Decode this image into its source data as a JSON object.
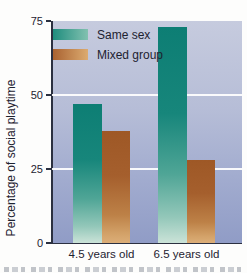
{
  "figure": {
    "type_note": "scanned textbook bar chart"
  },
  "chart_data": {
    "type": "bar",
    "title": "",
    "xlabel": "",
    "ylabel": "Percentage of social playtime",
    "categories": [
      "4.5 years old",
      "6.5 years old"
    ],
    "series": [
      {
        "name": "Same sex",
        "values": [
          47,
          73
        ],
        "color_top": "#0d7e74",
        "color_bottom": "#cbe3d8",
        "legend_gradient_left": "#1f8d7e",
        "legend_gradient_right": "#82c1b0"
      },
      {
        "name": "Mixed group",
        "values": [
          38,
          28
        ],
        "color_top": "#9e5826",
        "color_bottom": "#dcae78",
        "legend_gradient_left": "#a96231",
        "legend_gradient_right": "#dcab70"
      }
    ],
    "ylim": [
      0,
      75
    ],
    "yticks": [
      0,
      25,
      50,
      75
    ],
    "grid": "horizontal white gridlines at 25 and 50",
    "legend_position": "top-left inside plot"
  },
  "style": {
    "page_background": "#fdfdfc",
    "plot_background_top": "#c6cbde",
    "plot_background_bottom": "#909cc6",
    "gridline_color": "#ffffff",
    "axis_color": "#2b3040",
    "text_color": "#1d2230"
  }
}
